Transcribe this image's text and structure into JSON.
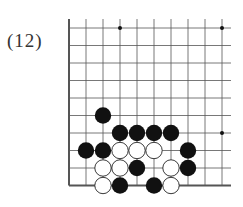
{
  "problem_label": "(12)",
  "board": {
    "cols": 10,
    "rows": 10,
    "x0": 69,
    "y0": 28,
    "dx": 17,
    "dy": 17.5,
    "edges": [
      "left",
      "bottom"
    ],
    "star_points": [
      [
        3,
        0
      ],
      [
        9,
        0
      ],
      [
        9,
        6
      ]
    ],
    "stones": {
      "black": [
        [
          2,
          5
        ],
        [
          3,
          6
        ],
        [
          4,
          6
        ],
        [
          5,
          6
        ],
        [
          6,
          6
        ],
        [
          1,
          7
        ],
        [
          2,
          7
        ],
        [
          7,
          7
        ],
        [
          4,
          8
        ],
        [
          7,
          8
        ],
        [
          3,
          9
        ],
        [
          5,
          9
        ]
      ],
      "white": [
        [
          3,
          7
        ],
        [
          4,
          7
        ],
        [
          5,
          7
        ],
        [
          2,
          8
        ],
        [
          3,
          8
        ],
        [
          6,
          8
        ],
        [
          2,
          9
        ],
        [
          6,
          9
        ]
      ]
    },
    "colors": {
      "black": "#111111",
      "white": "#ffffff",
      "line": "#555555"
    }
  }
}
